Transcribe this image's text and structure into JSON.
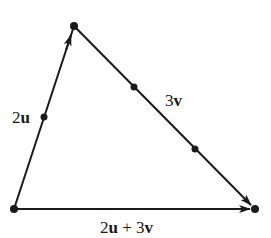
{
  "diagram": {
    "type": "vector-triangle",
    "colors": {
      "stroke": "#1a1a1a",
      "background": "#ffffff"
    },
    "vertices": {
      "origin": {
        "x": 14,
        "y": 209
      },
      "apex": {
        "x": 74,
        "y": 26
      },
      "end": {
        "x": 255,
        "y": 209
      }
    },
    "division_points": [
      {
        "name": "left-midpoint",
        "x": 44,
        "y": 117
      },
      {
        "name": "right-third-1",
        "x": 134,
        "y": 87
      },
      {
        "name": "right-third-2",
        "x": 195,
        "y": 149
      }
    ],
    "edges": [
      {
        "from": "origin",
        "to": "apex",
        "arrow": "mid-toward-apex",
        "label": {
          "coef": "2",
          "vec": "u"
        }
      },
      {
        "from": "apex",
        "to": "end",
        "arrow": "at-end",
        "label": {
          "coef": "3",
          "vec": "v"
        }
      },
      {
        "from": "origin",
        "to": "end",
        "arrow": "at-end",
        "label": {
          "coef1": "2",
          "vec1": "u",
          "op": " + ",
          "coef2": "3",
          "vec2": "v"
        }
      }
    ]
  }
}
